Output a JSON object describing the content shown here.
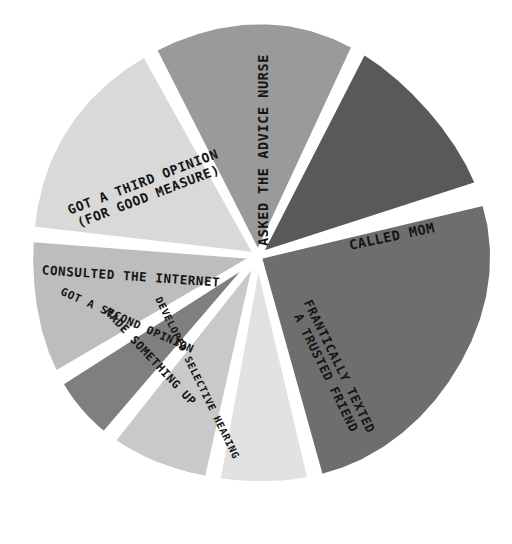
{
  "chart_data": {
    "type": "pie",
    "title": "",
    "subtitle": "",
    "xlabel": "",
    "ylabel": "",
    "legend_position": "none",
    "grid": false,
    "style": "hand-drawn marker illustration, grayscale",
    "background_color": "#ffffff",
    "label_color": "#151515",
    "center_x": 258,
    "center_y": 256,
    "radius": 232,
    "gap_degrees": 2.2,
    "categories": [
      "ASKED THE ADVICE NURSE",
      "CALLED MOM",
      "FRANTICALLY TEXTED A TRUSTED FRIEND",
      "DEVELOPED SELECTIVE HEARING",
      "MADE SOMETHING UP",
      "GOT A SECOND OPINION",
      "CONSULTED THE INTERNET",
      "GOT A THIRD OPINION (FOR GOOD MEASURE)"
    ],
    "values": [
      15.0,
      13.1,
      25.0,
      7.2,
      7.8,
      5.3,
      10.3,
      16.3
    ],
    "colors": [
      "#9a9a9a",
      "#595959",
      "#6e6e6e",
      "#e2e2e2",
      "#c9c9c9",
      "#7f7f7f",
      "#bdbdbd",
      "#d9d9d9"
    ],
    "slices": [
      {
        "id": "asked-the-advice-nurse",
        "label": "ASKED THE ADVICE NURSE",
        "label_lines": [
          "ASKED THE ADVICE NURSE"
        ],
        "value": 15.0,
        "color": "#9a9a9a",
        "start_angle": -118.0,
        "end_angle": -64.0,
        "label_x": 264,
        "label_y": 150,
        "label_rotation": -90,
        "label_font_size": 13.5,
        "label_anchor": "middle"
      },
      {
        "id": "called-mom",
        "label": "CALLED MOM",
        "label_lines": [
          "CALLED MOM"
        ],
        "value": 13.1,
        "color": "#595959",
        "start_angle": -64.0,
        "end_angle": -16.8,
        "label_x": 392,
        "label_y": 237,
        "label_rotation": -12,
        "label_font_size": 13.5,
        "label_anchor": "middle"
      },
      {
        "id": "frantically-texted-a-trusted-friend",
        "label": "FRANTICALLY TEXTED A TRUSTED FRIEND",
        "label_lines": [
          "FRANTICALLY TEXTED",
          "A TRUSTED FRIEND"
        ],
        "value": 25.0,
        "color": "#6e6e6e",
        "start_angle": -14.5,
        "end_angle": 75.5,
        "label_x": 332,
        "label_y": 370,
        "label_rotation": 64,
        "label_font_size": 12.5,
        "label_anchor": "middle"
      },
      {
        "id": "developed-selective-hearing",
        "label": "DEVELOPED SELECTIVE HEARING",
        "label_lines": [
          "DEVELOPED SELECTIVE HEARING"
        ],
        "value": 7.2,
        "color": "#e2e2e2",
        "start_angle": 75.5,
        "end_angle": 101.5,
        "label_x": 197,
        "label_y": 378,
        "label_rotation": 64,
        "label_font_size": 10,
        "label_anchor": "middle"
      },
      {
        "id": "made-something-up",
        "label": "MADE SOMETHING UP",
        "label_lines": [
          "MADE SOMETHING UP"
        ],
        "value": 7.8,
        "color": "#c9c9c9",
        "start_angle": 101.5,
        "end_angle": 129.5,
        "label_x": 150,
        "label_y": 357,
        "label_rotation": 47,
        "label_font_size": 11.5,
        "label_anchor": "middle"
      },
      {
        "id": "got-a-second-opinion",
        "label": "GOT A SECOND OPINION",
        "label_lines": [
          "GOT A SECOND OPINION"
        ],
        "value": 5.3,
        "color": "#7f7f7f",
        "start_angle": 129.5,
        "end_angle": 148.5,
        "label_x": 127,
        "label_y": 321,
        "label_rotation": 24,
        "label_font_size": 11,
        "label_anchor": "middle"
      },
      {
        "id": "consulted-the-internet",
        "label": "CONSULTED THE INTERNET",
        "label_lines": [
          "CONSULTED THE INTERNET"
        ],
        "value": 10.3,
        "color": "#bdbdbd",
        "start_angle": 148.5,
        "end_angle": 185.5,
        "label_x": 131,
        "label_y": 277,
        "label_rotation": 4,
        "label_font_size": 12.5,
        "label_anchor": "middle"
      },
      {
        "id": "got-a-third-opinion",
        "label": "GOT A THIRD OPINION (FOR GOOD MEASURE)",
        "label_lines": [
          "GOT A THIRD OPINION",
          "(FOR GOOD MEASURE)"
        ],
        "value": 16.3,
        "color": "#d9d9d9",
        "start_angle": 185.5,
        "end_angle": 242.0,
        "label_x": 146,
        "label_y": 190,
        "label_rotation": -21,
        "label_font_size": 13,
        "label_anchor": "middle"
      }
    ]
  }
}
